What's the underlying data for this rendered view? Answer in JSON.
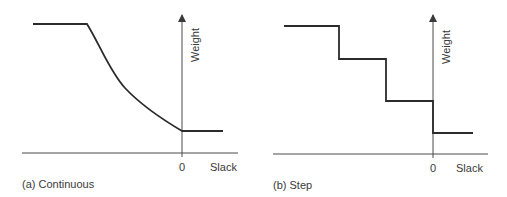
{
  "panels": [
    {
      "id": "a",
      "caption": "(a) Continuous",
      "type": "continuous",
      "y_axis_label": "Weight",
      "x_axis_label": "Slack",
      "origin_label": "0"
    },
    {
      "id": "b",
      "caption": "(b) Step",
      "type": "step",
      "y_axis_label": "Weight",
      "x_axis_label": "Slack",
      "origin_label": "0"
    }
  ],
  "colors": {
    "line": "#2b2b2b",
    "axis": "#4a4a4a",
    "text": "#3a3a3a",
    "background": "#ffffff"
  }
}
